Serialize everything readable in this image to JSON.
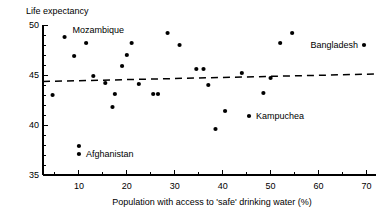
{
  "chart_data": {
    "type": "scatter",
    "title": "",
    "ylabel": "Life expectancy",
    "xlabel": "Population with access to 'safe' drinking water (%)",
    "xlim": [
      2.5,
      72
    ],
    "ylim": [
      35,
      50
    ],
    "xticks": [
      10,
      20,
      30,
      40,
      50,
      60,
      70
    ],
    "xtick_labels": [
      "10",
      "20",
      "30",
      "40",
      "50",
      "60",
      "70"
    ],
    "x_minor_ticks": [
      5,
      15,
      25,
      35,
      45,
      55,
      65
    ],
    "yticks": [
      35,
      40,
      45,
      50
    ],
    "ytick_labels": [
      "35",
      "40",
      "45",
      "50"
    ],
    "y_minor_ticks": [
      36,
      37,
      38,
      39,
      41,
      42,
      43,
      44,
      46,
      47,
      48,
      49
    ],
    "grid": false,
    "legend": "none",
    "points": [
      {
        "x": 4.5,
        "y": 43.0
      },
      {
        "x": 7.0,
        "y": 48.8
      },
      {
        "x": 9.0,
        "y": 46.9
      },
      {
        "x": 10.0,
        "y": 37.9
      },
      {
        "x": 10.0,
        "y": 37.1
      },
      {
        "x": 11.5,
        "y": 48.2
      },
      {
        "x": 13.0,
        "y": 44.9
      },
      {
        "x": 15.5,
        "y": 44.2
      },
      {
        "x": 17.0,
        "y": 41.8
      },
      {
        "x": 17.5,
        "y": 43.1
      },
      {
        "x": 19.0,
        "y": 45.9
      },
      {
        "x": 20.0,
        "y": 47.0
      },
      {
        "x": 21.0,
        "y": 48.2
      },
      {
        "x": 22.5,
        "y": 44.1
      },
      {
        "x": 25.5,
        "y": 43.1
      },
      {
        "x": 26.5,
        "y": 43.1
      },
      {
        "x": 28.5,
        "y": 49.2
      },
      {
        "x": 31.0,
        "y": 48.0
      },
      {
        "x": 34.5,
        "y": 45.6
      },
      {
        "x": 36.0,
        "y": 45.6
      },
      {
        "x": 37.0,
        "y": 44.0
      },
      {
        "x": 38.5,
        "y": 39.6
      },
      {
        "x": 40.5,
        "y": 41.4
      },
      {
        "x": 44.0,
        "y": 45.2
      },
      {
        "x": 45.5,
        "y": 40.9
      },
      {
        "x": 48.5,
        "y": 43.2
      },
      {
        "x": 50.0,
        "y": 44.7
      },
      {
        "x": 52.0,
        "y": 48.2
      },
      {
        "x": 54.5,
        "y": 49.2
      },
      {
        "x": 69.5,
        "y": 48.0
      }
    ],
    "annotations": [
      {
        "text": "Mozambique",
        "x": 7.0,
        "y": 48.8,
        "align": "start",
        "dx": 8,
        "dy": -4
      },
      {
        "text": "Bangladesh",
        "x": 69.5,
        "y": 48.0,
        "align": "end",
        "dx": -6,
        "dy": 3
      },
      {
        "text": "Kampuchea",
        "x": 45.5,
        "y": 40.9,
        "align": "start",
        "dx": 7,
        "dy": 3
      },
      {
        "text": "Afghanistan",
        "x": 10.0,
        "y": 37.1,
        "align": "start",
        "dx": 7,
        "dy": 3
      }
    ],
    "trend_line": {
      "style": "dashed",
      "x_start": 2.5,
      "y_start": 44.35,
      "x_end": 72,
      "y_end": 45.1
    },
    "colors": {
      "point": "#000000",
      "axis": "#000000",
      "trend": "#000000",
      "background": "#ffffff"
    }
  }
}
